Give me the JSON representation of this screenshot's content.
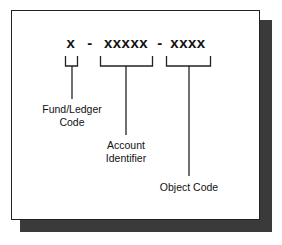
{
  "diagram": {
    "format": {
      "segments": [
        {
          "text": "x",
          "role": "fund-ledger"
        },
        {
          "text": "-",
          "role": "separator"
        },
        {
          "text": "xxxxx",
          "role": "account"
        },
        {
          "text": "-",
          "role": "separator"
        },
        {
          "text": "xxxx",
          "role": "object"
        }
      ]
    },
    "labels": {
      "fund_ledger": {
        "line1": "Fund/Ledger",
        "line2": "Code"
      },
      "account": {
        "line1": "Account",
        "line2": "Identifier"
      },
      "object": {
        "line1": "Object Code"
      }
    },
    "colors": {
      "line": "#222222",
      "shadow": "#3a3a3a",
      "background": "#ffffff"
    }
  }
}
